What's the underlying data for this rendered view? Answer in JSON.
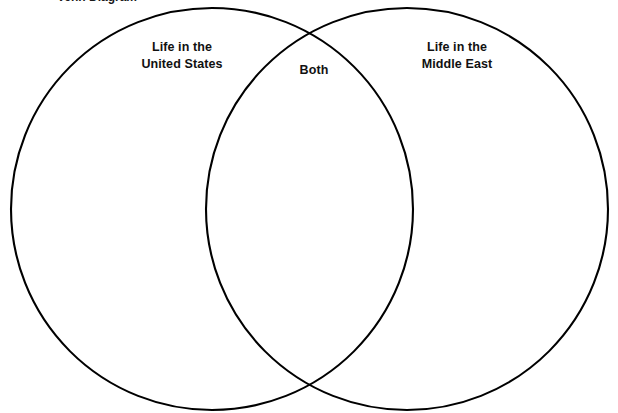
{
  "page": {
    "background_color": "#ffffff",
    "width": 618,
    "height": 413,
    "cropped_heading_fragment": "Venn Diagram"
  },
  "diagram": {
    "type": "venn-two-set",
    "stroke_color": "#000000",
    "stroke_width": 2.1,
    "fill": "none",
    "circles": [
      {
        "id": "left",
        "cx": 212,
        "cy": 209,
        "r": 201
      },
      {
        "id": "right",
        "cx": 407,
        "cy": 209,
        "r": 201
      }
    ],
    "labels": {
      "left": {
        "line1": "Life in the",
        "line2": "United States"
      },
      "center": {
        "line1": "Both"
      },
      "right": {
        "line1": "Life in the",
        "line2": "Middle East"
      }
    }
  }
}
